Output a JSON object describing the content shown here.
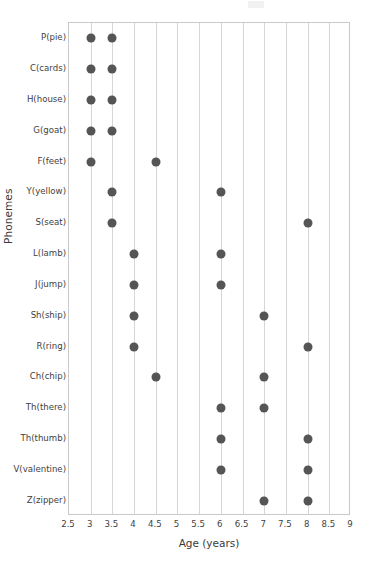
{
  "chart_data": {
    "type": "scatter",
    "title": "",
    "xlabel": "Age (years)",
    "ylabel": "Phonemes",
    "xlim": [
      2.5,
      9
    ],
    "xticks": [
      2.5,
      3,
      3.5,
      4,
      4.5,
      5,
      5.5,
      6,
      6.5,
      7,
      7.5,
      8,
      8.5,
      9
    ],
    "xtick_labels": [
      "2.5",
      "3",
      "3.5",
      "4",
      "4.5",
      "5",
      "5.5",
      "6",
      "6.5",
      "7",
      "7.5",
      "8",
      "8.5",
      "9"
    ],
    "categories": [
      "P(pie)",
      "C(cards)",
      "H(house)",
      "G(goat)",
      "F(feet)",
      "Y(yellow)",
      "S(seat)",
      "L(lamb)",
      "J(jump)",
      "Sh(ship)",
      "R(ring)",
      "Ch(chip)",
      "Th(there)",
      "Th(thumb)",
      "V(valentine)",
      "Z(zipper)"
    ],
    "series": [
      {
        "name": "Onset age",
        "values": [
          3,
          3,
          3,
          3,
          3,
          3.5,
          3.5,
          4,
          4,
          4,
          4,
          4.5,
          6,
          6,
          6,
          7
        ]
      },
      {
        "name": "Mastery age",
        "values": [
          3.5,
          3.5,
          3.5,
          3.5,
          4.5,
          6,
          8,
          6,
          6,
          7,
          8,
          7,
          7,
          8,
          8,
          8
        ]
      }
    ],
    "points": [
      {
        "category": "P(pie)",
        "x": [
          3,
          3.5
        ]
      },
      {
        "category": "C(cards)",
        "x": [
          3,
          3.5
        ]
      },
      {
        "category": "H(house)",
        "x": [
          3,
          3.5
        ]
      },
      {
        "category": "G(goat)",
        "x": [
          3,
          3.5
        ]
      },
      {
        "category": "F(feet)",
        "x": [
          3,
          4.5
        ]
      },
      {
        "category": "Y(yellow)",
        "x": [
          3.5,
          6
        ]
      },
      {
        "category": "S(seat)",
        "x": [
          3.5,
          8
        ]
      },
      {
        "category": "L(lamb)",
        "x": [
          4,
          6
        ]
      },
      {
        "category": "J(jump)",
        "x": [
          4,
          6
        ]
      },
      {
        "category": "Sh(ship)",
        "x": [
          4,
          7
        ]
      },
      {
        "category": "R(ring)",
        "x": [
          4,
          8
        ]
      },
      {
        "category": "Ch(chip)",
        "x": [
          4.5,
          7
        ]
      },
      {
        "category": "Th(there)",
        "x": [
          6,
          7
        ]
      },
      {
        "category": "Th(thumb)",
        "x": [
          6,
          8
        ]
      },
      {
        "category": "V(valentine)",
        "x": [
          6,
          8
        ]
      },
      {
        "category": "Z(zipper)",
        "x": [
          7,
          8
        ]
      }
    ],
    "grid": {
      "vertical": true,
      "horizontal": false
    },
    "legend": "none",
    "marker_color": "#555555",
    "gridline_color": "#d6d6d6",
    "axis_color": "#c9c9c9"
  }
}
